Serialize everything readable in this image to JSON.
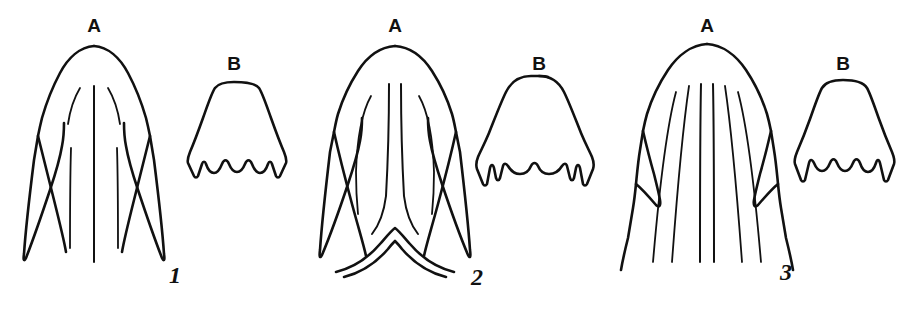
{
  "plate": {
    "title": "Comparative morphology plate",
    "background_color": "#ffffff",
    "ink_color": "#111111",
    "width": 918,
    "height": 316
  },
  "specimens": [
    {
      "number": "1",
      "number_x": 175,
      "number_y": 283,
      "parts": [
        {
          "key": "A",
          "label": "A",
          "label_x": 94,
          "label_y": 32
        },
        {
          "key": "B",
          "label": "B",
          "label_x": 234,
          "label_y": 70
        }
      ]
    },
    {
      "number": "2",
      "number_x": 477,
      "number_y": 285,
      "parts": [
        {
          "key": "A",
          "label": "A",
          "label_x": 395,
          "label_y": 32
        },
        {
          "key": "B",
          "label": "B",
          "label_x": 539,
          "label_y": 70
        }
      ]
    },
    {
      "number": "3",
      "number_x": 786,
      "number_y": 280,
      "parts": [
        {
          "key": "A",
          "label": "A",
          "label_x": 707,
          "label_y": 32
        },
        {
          "key": "B",
          "label": "B",
          "label_x": 843,
          "label_y": 70
        }
      ]
    }
  ]
}
